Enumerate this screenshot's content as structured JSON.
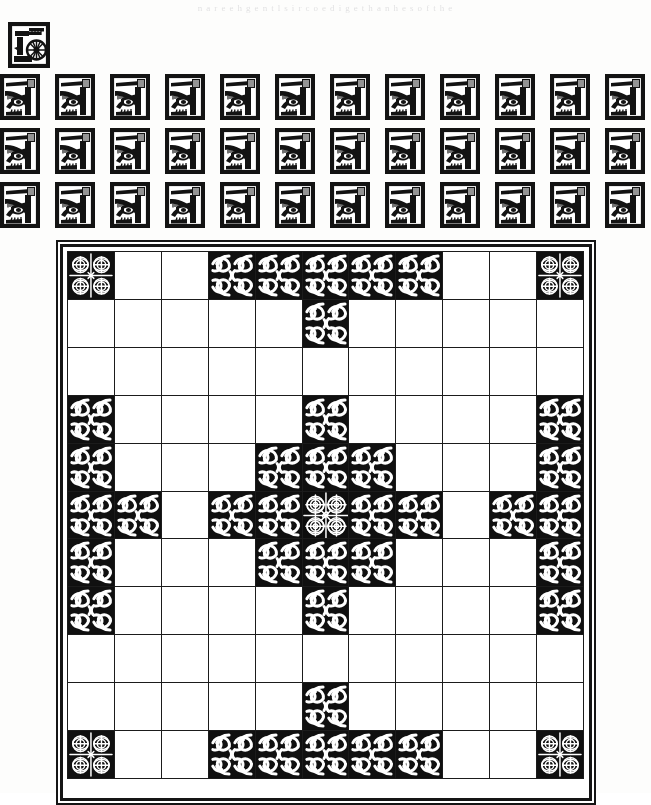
{
  "page": {
    "ghost_text": "n  a  r e  e  h  g    e n t  l  s  i r  c  o  e d  i  g e  t  h  a  n  h  e  s  o f  t  h e",
    "background_color": "#fdfdfc",
    "ink_color": "#131313"
  },
  "hero_block": {
    "name": "watermill-woodcut",
    "caption": "",
    "width": 42,
    "height": 46
  },
  "icon_band": {
    "name": "ornament-band",
    "icon_name": "fish-knot-woodcut",
    "rows": 3,
    "columns": 12,
    "cell_width": 40,
    "cell_height": 46,
    "column_step": 55,
    "row_step": 54,
    "last_column_clipped": true,
    "total_icons": 36
  },
  "board": {
    "name": "hnefatafl-board",
    "size": 11,
    "rows": 11,
    "columns": 11,
    "frame_color": "#151515",
    "grid_line_color": "#1b1b1b",
    "cell_color": "#ffffff",
    "piece_color": "#101010",
    "legend": {
      "empty": "empty square",
      "attacker": "attacker knot piece",
      "defender": "defender knot piece",
      "corner": "corner refuge square",
      "throne": "central throne square"
    },
    "cells": [
      [
        "corner",
        "empty",
        "empty",
        "attacker",
        "attacker",
        "attacker",
        "attacker",
        "attacker",
        "empty",
        "empty",
        "corner"
      ],
      [
        "empty",
        "empty",
        "empty",
        "empty",
        "empty",
        "attacker",
        "empty",
        "empty",
        "empty",
        "empty",
        "empty"
      ],
      [
        "empty",
        "empty",
        "empty",
        "empty",
        "empty",
        "empty",
        "empty",
        "empty",
        "empty",
        "empty",
        "empty"
      ],
      [
        "attacker",
        "empty",
        "empty",
        "empty",
        "empty",
        "defender",
        "empty",
        "empty",
        "empty",
        "empty",
        "attacker"
      ],
      [
        "attacker",
        "empty",
        "empty",
        "empty",
        "defender",
        "defender",
        "defender",
        "empty",
        "empty",
        "empty",
        "attacker"
      ],
      [
        "attacker",
        "attacker",
        "empty",
        "defender",
        "defender",
        "throne",
        "defender",
        "defender",
        "empty",
        "attacker",
        "attacker"
      ],
      [
        "attacker",
        "empty",
        "empty",
        "empty",
        "defender",
        "defender",
        "defender",
        "empty",
        "empty",
        "empty",
        "attacker"
      ],
      [
        "attacker",
        "empty",
        "empty",
        "empty",
        "empty",
        "defender",
        "empty",
        "empty",
        "empty",
        "empty",
        "attacker"
      ],
      [
        "empty",
        "empty",
        "empty",
        "empty",
        "empty",
        "empty",
        "empty",
        "empty",
        "empty",
        "empty",
        "empty"
      ],
      [
        "empty",
        "empty",
        "empty",
        "empty",
        "empty",
        "attacker",
        "empty",
        "empty",
        "empty",
        "empty",
        "empty"
      ],
      [
        "corner",
        "empty",
        "empty",
        "attacker",
        "attacker",
        "attacker",
        "attacker",
        "attacker",
        "empty",
        "empty",
        "corner"
      ]
    ],
    "counts": {
      "attackers": 24,
      "defenders": 12,
      "corners": 4,
      "throne": 1,
      "empty": 80
    }
  }
}
